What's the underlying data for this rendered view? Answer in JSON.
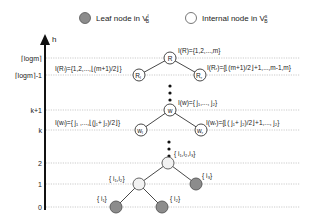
{
  "legend": {
    "leaf_label": "Leaf node in V",
    "leaf_sup": "l",
    "leaf_sub": "B",
    "internal_label": "Internal node in V",
    "internal_sup": "s",
    "internal_sub": "B"
  },
  "axis": {
    "label": "h",
    "levels": [
      {
        "label": "⌈logm⌉",
        "y": 58
      },
      {
        "label": "⌈logm⌉-1",
        "y": 75
      },
      {
        "label": "k+1",
        "y": 110
      },
      {
        "label": "k",
        "y": 130
      },
      {
        "label": "2",
        "y": 163
      },
      {
        "label": "1",
        "y": 184
      },
      {
        "label": "0",
        "y": 207
      }
    ]
  },
  "nodes": {
    "R": {
      "label": "R",
      "annotation": "I(R)={1,2,...,m}"
    },
    "Rl": {
      "label": "R",
      "sub": "l",
      "annotation": "I(Rₗ)={1,2,...,⌊(m+1)/2⌋}"
    },
    "Rr": {
      "label": "R",
      "sub": "r",
      "annotation": "I(Rᵣ)={⌊(m+1)/2⌋+1,...,m-1,m}"
    },
    "w": {
      "label": "w",
      "annotation": "I(w)={ j₁,..., j₂}"
    },
    "wl": {
      "label": "w",
      "sub": "l",
      "annotation": "I(wₗ)={ j₁ ,...,⌊(j₁+ j₂)/2⌋}"
    },
    "wr": {
      "label": "w",
      "sub": "r",
      "annotation": "I(wᵣ)={⌊( j₁+ j₂)/2⌋+1,..., j₂}"
    },
    "i123": {
      "annotation": "{ i₁,i₂,i₃}"
    },
    "i12": {
      "annotation": "{ i₁,i₂}"
    },
    "i3": {
      "annotation": "{ i₃}"
    },
    "i1": {
      "annotation": "{ i₁}"
    },
    "i2": {
      "annotation": "{ i₂}"
    }
  },
  "colors": {
    "leaf_fill": "#8c8c8c",
    "internal_fill": "#f2f2f2",
    "stroke": "#333333",
    "gridline": "#b5b5b5"
  }
}
